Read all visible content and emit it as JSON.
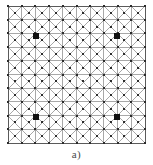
{
  "figure": {
    "caption": "a)",
    "kind": "finite-element-mesh",
    "background_color": "#ffffff"
  },
  "chart_data": {
    "type": "diagram",
    "title": "a)",
    "subtitle": "",
    "xlabel": "",
    "ylabel": "",
    "grid": true,
    "legend_position": "none",
    "mesh": {
      "description": "Square domain discretized into a uniform 10 by 10 grid of square cells; each cell is subdivided by both diagonals into four triangles, producing a node at every cell corner and at every cell center.",
      "columns": 10,
      "rows": 10,
      "cell_size_px": 13.7,
      "origin_x_px": 8,
      "origin_y_px": 6,
      "width_px": 137,
      "height_px": 137,
      "diagonals": "both",
      "line_color": "#6e6e6e",
      "line_width_px": 0.6,
      "border_color": "#5a5a5a",
      "border_width_px": 1.0,
      "node_color": "#2b2b2b",
      "node_radius_px": 1.0,
      "corner_nodes": true,
      "center_nodes": true
    },
    "markers": {
      "label": "highlighted nodes",
      "shape": "square",
      "color": "#101010",
      "size_px": 5.5,
      "count": 4,
      "points": [
        {
          "name": "marker-top-left",
          "grid_col": 2,
          "grid_row": 2,
          "x_px": 36,
          "y_px": 36
        },
        {
          "name": "marker-top-right",
          "grid_col": 8,
          "grid_row": 2,
          "x_px": 117,
          "y_px": 36
        },
        {
          "name": "marker-bottom-left",
          "grid_col": 2,
          "grid_row": 8,
          "x_px": 36,
          "y_px": 117
        },
        {
          "name": "marker-bottom-right",
          "grid_col": 8,
          "grid_row": 8,
          "x_px": 117,
          "y_px": 117
        }
      ]
    },
    "xlim": [
      0,
      10
    ],
    "ylim": [
      0,
      10
    ]
  }
}
